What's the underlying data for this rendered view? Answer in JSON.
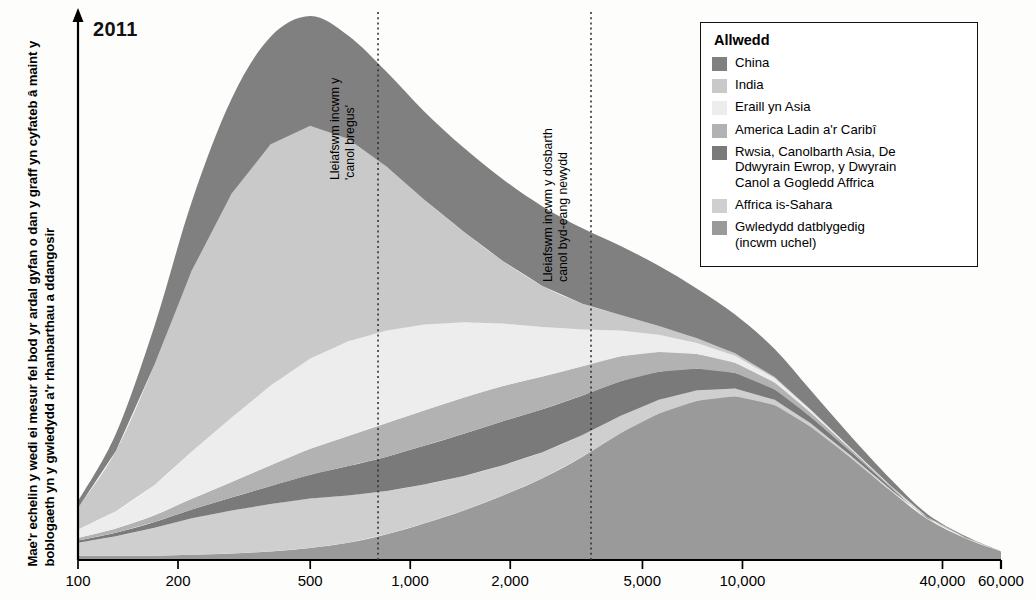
{
  "chart": {
    "year_label": "2011",
    "y_axis_note": "Mae'r echelin y wedi ei mesur fel bod yr ardal gyfan o dan y graff yn cyfateb â maint y boblogaeth yn y gwledydd a'r rhanbarthau a ddangosir",
    "annotation_1": "Lleiafswm incwm y\n'canol bregus'",
    "annotation_2": "Lleiafswm incwm y dosbarth\ncanol byd-eang newydd"
  },
  "legend": {
    "title": "Allwedd",
    "items": [
      {
        "label": "China",
        "color": "#808080"
      },
      {
        "label": "India",
        "color": "#c9c9c9"
      },
      {
        "label": "Eraill yn Asia",
        "color": "#ededed"
      },
      {
        "label": "America Ladin a'r Caribî",
        "color": "#b2b2b2"
      },
      {
        "label": "Rwsia, Canolbarth Asia, De\nDdwyrain Ewrop, y Dwyrain\nCanol a Gogledd Affrica",
        "color": "#7a7a7a"
      },
      {
        "label": "Affrica is-Sahara",
        "color": "#cfcfcf"
      },
      {
        "label": "Gwledydd datblygedig\n(incwm uchel)",
        "color": "#9a9a9a"
      }
    ]
  },
  "chart_data": {
    "type": "area",
    "title": "2011",
    "xlabel": "",
    "ylabel": "Mae'r echelin y wedi ei mesur fel bod yr ardal gyfan o dan y graff yn cyfateb â maint y boblogaeth yn y gwledydd a'r rhanbarthau a ddangosir",
    "x_scale": "log",
    "xlim": [
      100,
      60000
    ],
    "ylim": [
      0,
      100
    ],
    "grid": false,
    "legend_position": "top-right",
    "stacking": "stacked-area",
    "xticks": [
      100,
      200,
      500,
      1000,
      2000,
      5000,
      10000,
      40000,
      60000
    ],
    "xtick_labels": [
      "100",
      "200",
      "500",
      "1,000",
      "2,000",
      "5,000",
      "10,000",
      "40,000",
      "60,000"
    ],
    "annotations": [
      {
        "text": "Lleiafswm incwm y 'canol bregus'",
        "x": 800,
        "type": "vline",
        "style": "dotted"
      },
      {
        "text": "Lleiafswm incwm y dosbarth canol byd-eang newydd",
        "x": 3500,
        "type": "vline",
        "style": "dotted"
      }
    ],
    "x": [
      100,
      130,
      170,
      220,
      290,
      380,
      500,
      650,
      850,
      1100,
      1450,
      1900,
      2500,
      3300,
      4300,
      5600,
      7300,
      9500,
      12500,
      16000,
      21000,
      28000,
      36000,
      47000,
      60000
    ],
    "series": [
      {
        "name": "Gwledydd datblygedig (incwm uchel)",
        "color": "#9a9a9a",
        "values": [
          1.0,
          1.0,
          1.0,
          1.2,
          1.5,
          2.0,
          2.8,
          4.0,
          6.0,
          8.5,
          11.5,
          15.0,
          19.0,
          24.0,
          29.5,
          34.0,
          37.0,
          38.0,
          36.0,
          31.0,
          24.0,
          16.0,
          9.5,
          5.0,
          2.0
        ]
      },
      {
        "name": "Affrica is-Sahara",
        "color": "#cfcfcf",
        "values": [
          3.0,
          4.5,
          6.5,
          8.5,
          10.0,
          11.0,
          11.5,
          11.0,
          10.0,
          9.0,
          8.0,
          7.0,
          6.0,
          5.0,
          4.0,
          3.2,
          2.4,
          1.8,
          1.2,
          0.8,
          0.5,
          0.3,
          0.2,
          0.1,
          0.0
        ]
      },
      {
        "name": "Rwsia, Canolbarth Asia, De Ddwyrain Ewrop, y Dwyrain Canol a Gogledd Affrica",
        "color": "#7a7a7a",
        "values": [
          0.5,
          0.8,
          1.3,
          2.0,
          3.0,
          4.2,
          5.5,
          6.8,
          8.0,
          9.0,
          9.8,
          10.2,
          10.0,
          9.2,
          8.0,
          6.5,
          5.0,
          3.6,
          2.4,
          1.5,
          0.9,
          0.5,
          0.2,
          0.1,
          0.0
        ]
      },
      {
        "name": "America Ladin a'r Caribî",
        "color": "#b2b2b2",
        "values": [
          0.6,
          1.0,
          1.6,
          2.5,
          3.6,
          4.8,
          6.0,
          7.0,
          7.8,
          8.2,
          8.4,
          8.2,
          7.6,
          6.8,
          5.8,
          4.6,
          3.4,
          2.4,
          1.6,
          1.0,
          0.6,
          0.3,
          0.1,
          0.0,
          0.0
        ]
      },
      {
        "name": "Eraill yn Asia",
        "color": "#ededed",
        "values": [
          2.0,
          4.0,
          7.0,
          11.0,
          15.0,
          18.5,
          21.0,
          22.0,
          21.5,
          20.0,
          17.5,
          14.5,
          11.5,
          8.5,
          6.0,
          4.0,
          2.6,
          1.6,
          1.0,
          0.6,
          0.3,
          0.1,
          0.0,
          0.0,
          0.0
        ]
      },
      {
        "name": "India",
        "color": "#c9c9c9",
        "values": [
          5.0,
          14.0,
          28.0,
          42.0,
          52.0,
          56.0,
          54.0,
          47.0,
          38.0,
          29.0,
          21.0,
          14.5,
          9.5,
          6.0,
          3.6,
          2.0,
          1.1,
          0.6,
          0.3,
          0.1,
          0.0,
          0.0,
          0.0,
          0.0,
          0.0
        ]
      },
      {
        "name": "China",
        "color": "#808080",
        "values": [
          1.5,
          4.0,
          9.0,
          16.0,
          22.0,
          25.0,
          25.5,
          24.0,
          22.0,
          20.5,
          19.5,
          19.0,
          18.5,
          17.5,
          16.0,
          14.0,
          11.5,
          9.0,
          6.5,
          4.5,
          2.8,
          1.5,
          0.7,
          0.3,
          0.0
        ]
      }
    ]
  }
}
